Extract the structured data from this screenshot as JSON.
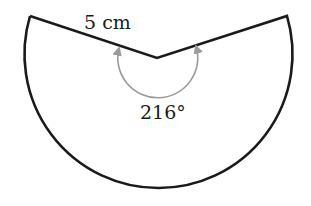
{
  "diagram": {
    "type": "circular-sector",
    "radius_label": "5 cm",
    "angle_label": "216°",
    "radius_value": 5,
    "radius_unit": "cm",
    "central_angle_deg": 216,
    "colors": {
      "outline": "#1a1a1a",
      "angle_arc": "#9a9a9a",
      "background": "#ffffff"
    }
  }
}
